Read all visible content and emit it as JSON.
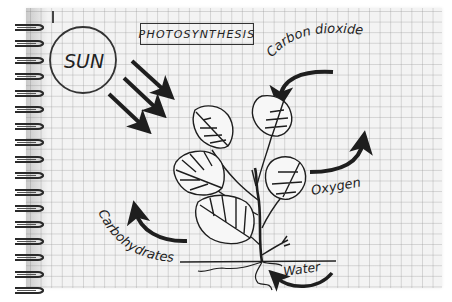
{
  "diagram": {
    "title": "PHOTOSYNTHESIS",
    "type": "hand-drawn process diagram on spiral graph-paper notebook",
    "sun": {
      "label": "SUN",
      "rays": 3
    },
    "plant": {
      "leaves": 5,
      "has_roots": true,
      "ground_line": true
    },
    "labels": {
      "carbon_dioxide": "Carbon dioxide",
      "oxygen": "Oxygen",
      "carbohydrates": "Carbohydrates",
      "water": "Water"
    },
    "flows": [
      {
        "from": "sun",
        "to": "plant",
        "label": "light",
        "arrows": 3
      },
      {
        "from": "air",
        "to": "plant",
        "label": "Carbon dioxide",
        "direction": "in"
      },
      {
        "from": "plant",
        "to": "air",
        "label": "Oxygen",
        "direction": "out"
      },
      {
        "from": "plant",
        "to": "plant",
        "label": "Carbohydrates",
        "direction": "out"
      },
      {
        "from": "soil",
        "to": "roots",
        "label": "Water",
        "direction": "in"
      }
    ]
  },
  "notebook": {
    "rings": 17,
    "grid": "square",
    "paper_color": "#f3f3f3",
    "ink_color": "#1e1e1e"
  }
}
